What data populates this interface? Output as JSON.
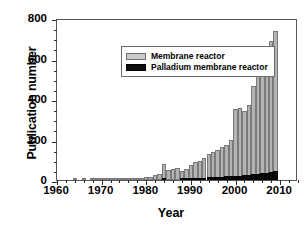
{
  "chart_data": {
    "type": "bar",
    "title": "",
    "xlabel": "Year",
    "ylabel": "Publication number",
    "xlim": [
      1960,
      2014
    ],
    "ylim": [
      0,
      800
    ],
    "yticks": [
      0,
      200,
      400,
      600,
      800
    ],
    "ytick_labels": [
      "0",
      "200",
      "400",
      "600",
      "800"
    ],
    "yminor_interval": 50,
    "xticks": [
      1960,
      1970,
      1980,
      1990,
      2000,
      2010
    ],
    "xtick_labels": [
      "1960",
      "1970",
      "1980",
      "1990",
      "2000",
      "2010"
    ],
    "xminor_interval": 2,
    "grid": false,
    "legend_position": "upper-left-inside",
    "stacked": true,
    "bar_style": "overlaid-stacked",
    "x": [
      1960,
      1961,
      1962,
      1963,
      1964,
      1965,
      1966,
      1967,
      1968,
      1969,
      1970,
      1971,
      1972,
      1973,
      1974,
      1975,
      1976,
      1977,
      1978,
      1979,
      1980,
      1981,
      1982,
      1983,
      1984,
      1985,
      1986,
      1987,
      1988,
      1989,
      1990,
      1991,
      1992,
      1993,
      1994,
      1995,
      1996,
      1997,
      1998,
      1999,
      2000,
      2001,
      2002,
      2003,
      2004,
      2005,
      2006,
      2007,
      2008,
      2009
    ],
    "series": [
      {
        "name": "Membrane reactor",
        "color": "#b3b3b3",
        "values": [
          0,
          0,
          0,
          0,
          1,
          0,
          1,
          0,
          2,
          3,
          4,
          2,
          3,
          5,
          6,
          8,
          7,
          9,
          9,
          12,
          14,
          16,
          23,
          30,
          78,
          48,
          52,
          58,
          46,
          52,
          72,
          88,
          92,
          108,
          128,
          138,
          148,
          162,
          172,
          196,
          352,
          358,
          342,
          372,
          462,
          628,
          652,
          592,
          688,
          738
        ]
      },
      {
        "name": "Palladium membrane reactor",
        "color": "#0d0d0d",
        "values": [
          0,
          0,
          0,
          0,
          0,
          0,
          0,
          0,
          0,
          0,
          0,
          0,
          0,
          0,
          0,
          0,
          0,
          0,
          0,
          0,
          0,
          0,
          0,
          0,
          3,
          0,
          0,
          0,
          6,
          8,
          8,
          9,
          10,
          12,
          13,
          14,
          16,
          14,
          18,
          20,
          22,
          21,
          23,
          24,
          28,
          30,
          33,
          36,
          42,
          46
        ]
      }
    ]
  },
  "legend": {
    "items": [
      {
        "label": "Membrane reactor",
        "swatch": "gray"
      },
      {
        "label": "Palladium membrane reactor",
        "swatch": "black"
      }
    ]
  }
}
